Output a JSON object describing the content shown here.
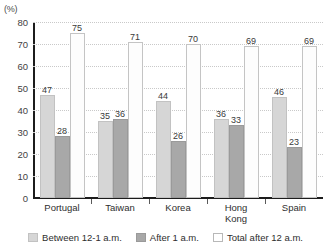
{
  "chart_data": {
    "type": "bar",
    "title": "",
    "xlabel": "",
    "ylabel": "(%)",
    "unit_label": "(%)",
    "ylim": [
      0,
      80
    ],
    "ytick_step": 10,
    "yticks": [
      "80",
      "70",
      "60",
      "50",
      "40",
      "30",
      "20",
      "10",
      "0"
    ],
    "grid": true,
    "legend_position": "bottom",
    "categories": [
      "Portugal",
      "Taiwan",
      "Korea",
      "Hong\nKong",
      "Spain"
    ],
    "series": [
      {
        "name": "Between 12-1 a.m.",
        "color": "#d6d6d6",
        "values": [
          47,
          35,
          44,
          36,
          46
        ]
      },
      {
        "name": "After 1 a.m.",
        "color": "#a8a8a8",
        "values": [
          28,
          36,
          26,
          33,
          23
        ]
      },
      {
        "name": "Total after 12 a.m.",
        "color": "#ffffff",
        "values": [
          75,
          71,
          70,
          69,
          69
        ]
      }
    ]
  },
  "legend": {
    "items": [
      {
        "label": "Between 12-1 a.m."
      },
      {
        "label": "After 1 a.m."
      },
      {
        "label": "Total after 12 a.m."
      }
    ]
  }
}
